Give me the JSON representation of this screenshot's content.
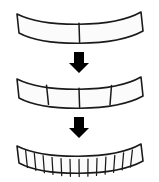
{
  "figure": {
    "background_color": "#ffffff",
    "stroke_color": "#1a1a1a",
    "fill_color": "#fbfbfb",
    "arrow_color": "#000000",
    "stage_count": 3,
    "arrow_count": 2
  },
  "stages": [
    {
      "index": 1,
      "name": "arc-two-segments",
      "segment_count": 2,
      "segment_labels": [
        "",
        ""
      ],
      "y_top": 10,
      "y_bottom": 46
    },
    {
      "index": 2,
      "name": "arc-four-segments",
      "segment_count": 4,
      "segment_labels": [
        "",
        "",
        "",
        ""
      ],
      "y_top": 75,
      "y_bottom": 111
    },
    {
      "index": 3,
      "name": "arc-fourteen-segments",
      "segment_count": 14,
      "segment_labels": [
        "",
        "",
        "",
        "",
        "",
        "",
        "",
        "",
        "",
        "",
        "",
        "",
        "",
        ""
      ],
      "y_top": 142,
      "y_bottom": 176
    }
  ],
  "arrows": [
    {
      "index": 1,
      "name": "arrow-stage1-to-stage2",
      "direction": "down",
      "glyph": "↓",
      "cx": 79,
      "y_top": 52,
      "y_bottom": 71
    },
    {
      "index": 2,
      "name": "arrow-stage2-to-stage3",
      "direction": "down",
      "glyph": "↓",
      "cx": 79,
      "y_top": 117,
      "y_bottom": 137
    }
  ],
  "geometry": {
    "arc_left_x": 17,
    "arc_right_x": 143,
    "arc_sag": 13,
    "band_thickness": 19,
    "band_thickness_small": 17
  }
}
